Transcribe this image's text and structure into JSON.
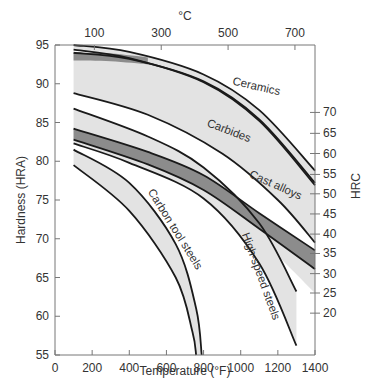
{
  "chart_data": {
    "type": "area",
    "title": "",
    "xlabel": "Temperature (°F)",
    "ylabel": "Hardness (HRA)",
    "x2label": "°C",
    "y2label": "HRC",
    "xlim": [
      0,
      1400
    ],
    "ylim": [
      55,
      95
    ],
    "xticks": [
      0,
      200,
      400,
      600,
      800,
      1000,
      1200,
      1400
    ],
    "yticks": [
      55,
      60,
      65,
      70,
      75,
      80,
      85,
      90,
      95
    ],
    "top_ticks": [
      {
        "label": "100",
        "F": 212
      },
      {
        "label": "300",
        "F": 572
      },
      {
        "label": "500",
        "F": 932
      },
      {
        "label": "700",
        "F": 1292
      }
    ],
    "right_ticks": [
      {
        "label": "70",
        "HRA": 86.3
      },
      {
        "label": "65",
        "HRA": 83.6
      },
      {
        "label": "60",
        "HRA": 81.0
      },
      {
        "label": "55",
        "HRA": 78.3
      },
      {
        "label": "50",
        "HRA": 75.8
      },
      {
        "label": "45",
        "HRA": 73.2
      },
      {
        "label": "40",
        "HRA": 70.6
      },
      {
        "label": "35",
        "HRA": 68.1
      },
      {
        "label": "30",
        "HRA": 65.5
      },
      {
        "label": "25",
        "HRA": 63.0
      },
      {
        "label": "20",
        "HRA": 60.4
      }
    ],
    "grid": false,
    "series": [
      {
        "name": "Carbides",
        "fill": "#e3e3e3",
        "upper": [
          [
            100,
            94.0
          ],
          [
            400,
            93.2
          ],
          [
            800,
            90.3
          ],
          [
            1100,
            85.4
          ],
          [
            1400,
            77.2
          ]
        ],
        "lower": [
          [
            100,
            88.8
          ],
          [
            500,
            86.0
          ],
          [
            900,
            81.0
          ],
          [
            1200,
            75.0
          ],
          [
            1400,
            69.5
          ]
        ]
      },
      {
        "name": "Ceramics",
        "fill": "#e3e3e3",
        "upper": [
          [
            100,
            95.0
          ],
          [
            400,
            94.1
          ],
          [
            800,
            91.2
          ],
          [
            1100,
            86.6
          ],
          [
            1400,
            78.8
          ]
        ],
        "lower": [
          [
            100,
            94.4
          ],
          [
            400,
            93.3
          ],
          [
            800,
            90.2
          ],
          [
            1100,
            85.2
          ],
          [
            1400,
            76.9
          ]
        ]
      },
      {
        "name": "Ceramics-Carbides overlap",
        "fill": "#8c8c8c",
        "upper": [
          [
            100,
            94.0
          ],
          [
            300,
            93.9
          ],
          [
            500,
            93.4
          ]
        ],
        "lower": [
          [
            100,
            93.0
          ],
          [
            300,
            92.9
          ],
          [
            500,
            92.5
          ]
        ]
      },
      {
        "name": "High-speed steels",
        "fill": "#e3e3e3",
        "upper": [
          [
            100,
            86.8
          ],
          [
            500,
            83.2
          ],
          [
            800,
            79.2
          ],
          [
            1100,
            72.0
          ],
          [
            1300,
            63.2
          ]
        ],
        "lower": [
          [
            100,
            82.3
          ],
          [
            400,
            79.8
          ],
          [
            800,
            75.2
          ],
          [
            1100,
            66.8
          ],
          [
            1300,
            56.2
          ]
        ]
      },
      {
        "name": "Cast alloys",
        "fill": "#8c8c8c",
        "upper": [
          [
            100,
            84.2
          ],
          [
            500,
            81.2
          ],
          [
            800,
            78.2
          ],
          [
            1100,
            73.3
          ],
          [
            1400,
            68.5
          ]
        ],
        "lower": [
          [
            100,
            82.8
          ],
          [
            500,
            79.6
          ],
          [
            800,
            76.3
          ],
          [
            1100,
            71.3
          ],
          [
            1400,
            66.1
          ]
        ]
      },
      {
        "name": "Cast alloys (light)",
        "fill": "#e3e3e3",
        "upper": [
          [
            800,
            76.3
          ],
          [
            1100,
            71.3
          ],
          [
            1400,
            66.1
          ]
        ],
        "lower": [
          [
            800,
            75.2
          ],
          [
            1100,
            70.0
          ],
          [
            1400,
            63.0
          ]
        ]
      },
      {
        "name": "Carbon tool steels",
        "fill": "#e3e3e3",
        "upper": [
          [
            100,
            81.5
          ],
          [
            400,
            77.2
          ],
          [
            650,
            69.3
          ],
          [
            760,
            61.0
          ],
          [
            790,
            55.0
          ]
        ],
        "lower": [
          [
            100,
            79.5
          ],
          [
            400,
            73.6
          ],
          [
            650,
            65.0
          ],
          [
            740,
            58.0
          ],
          [
            760,
            55.0
          ]
        ]
      }
    ],
    "annotations": [
      {
        "text": "Ceramics",
        "x": 1080,
        "y": 89.2,
        "rot": 13
      },
      {
        "text": "Carbides",
        "x": 930,
        "y": 83.5,
        "rot": 21
      },
      {
        "text": "Cast alloys",
        "x": 1180,
        "y": 76.5,
        "rot": 24
      },
      {
        "text": "Carbon tool steels",
        "x": 630,
        "y": 71,
        "rot": 58
      },
      {
        "text": "High-speed steels",
        "x": 1090,
        "y": 65,
        "rot": 70
      }
    ]
  }
}
